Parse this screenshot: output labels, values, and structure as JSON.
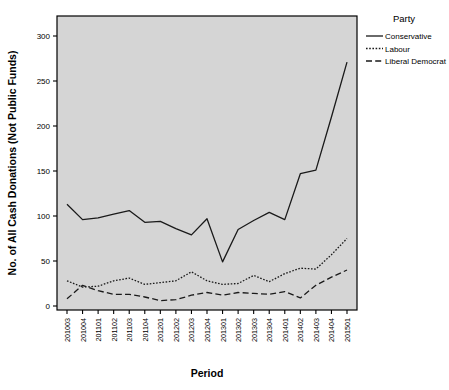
{
  "chart_data": {
    "type": "line",
    "title": "",
    "xlabel": "Period",
    "ylabel": "No. of All Cash Donations (Not Public Funds)",
    "ylim": [
      0,
      310
    ],
    "yticks": [
      0,
      50,
      100,
      150,
      200,
      250,
      300
    ],
    "ytick_labels": [
      "0",
      "50",
      "100",
      "150",
      "200",
      "250",
      "300"
    ],
    "grid": false,
    "legend_position": "right",
    "legend_title": "Party",
    "categories": [
      "201003",
      "201004",
      "201101",
      "201102",
      "201103",
      "201104",
      "201201",
      "201202",
      "201203",
      "201204",
      "201301",
      "201302",
      "201303",
      "201304",
      "201401",
      "201402",
      "201403",
      "201404",
      "201501"
    ],
    "series": [
      {
        "name": "Conservative",
        "style": "solid",
        "color": "#1a1a1a",
        "values": [
          113,
          96,
          98,
          102,
          106,
          93,
          94,
          86,
          79,
          97,
          49,
          85,
          95,
          104,
          96,
          147,
          151,
          210,
          271
        ]
      },
      {
        "name": "Labour",
        "style": "dotted",
        "color": "#1a1a1a",
        "values": [
          28,
          21,
          22,
          28,
          31,
          24,
          26,
          28,
          38,
          28,
          24,
          25,
          34,
          27,
          36,
          42,
          41,
          57,
          75
        ]
      },
      {
        "name": "Liberal Democrat",
        "style": "dashed",
        "color": "#1a1a1a",
        "values": [
          8,
          23,
          17,
          13,
          13,
          10,
          6,
          7,
          12,
          15,
          12,
          15,
          14,
          13,
          16,
          9,
          23,
          32,
          40
        ]
      }
    ]
  },
  "figure": {
    "background_color": "#ffffff",
    "plot_area_color": "#d5d5d5",
    "border_color": "#000000"
  }
}
